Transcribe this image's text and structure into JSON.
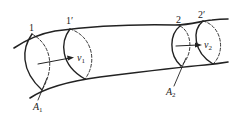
{
  "diagram": {
    "sections": [
      {
        "id": "sec-1",
        "label": "1"
      },
      {
        "id": "sec-1prime",
        "label": "1′"
      },
      {
        "id": "sec-2",
        "label": "2"
      },
      {
        "id": "sec-2prime",
        "label": "2′"
      }
    ],
    "velocities": [
      {
        "id": "v1",
        "symbol": "v",
        "subscript": "1"
      },
      {
        "id": "v2",
        "symbol": "v",
        "subscript": "2"
      }
    ],
    "areas": [
      {
        "id": "A1",
        "symbol": "A",
        "subscript": "1"
      },
      {
        "id": "A2",
        "symbol": "A",
        "subscript": "2"
      }
    ],
    "colors": {
      "stroke": "#222222",
      "background": "#ffffff"
    }
  }
}
